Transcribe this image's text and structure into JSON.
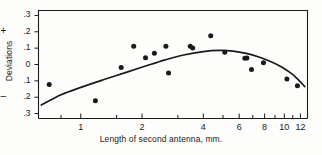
{
  "figure": {
    "background_color": "#fdfdfb",
    "ink_color": "#1a1a1a"
  },
  "axes": {
    "y_axis_label": "Deviations",
    "y_sign_positive": "+",
    "y_sign_negative": "–",
    "x_axis_caption": "Length of second antenna, mm."
  },
  "chart_data": {
    "type": "scatter",
    "title": "",
    "subtitle": "",
    "xlabel": "Length of second antenna, mm.",
    "ylabel": "Deviations",
    "xscale": "log",
    "yscale": "linear",
    "grid": false,
    "legend": null,
    "xlim": [
      0.62,
      13.0
    ],
    "ylim": [
      -0.33,
      0.33
    ],
    "xticks": [
      1,
      2,
      4,
      6,
      8,
      10,
      12
    ],
    "xticklabels": [
      "1",
      "2",
      "4",
      "6",
      "8",
      "10",
      "12"
    ],
    "x_minor_ticks": [
      0.8,
      1.5,
      3,
      5,
      7,
      9,
      11
    ],
    "yticks": [
      0.3,
      0.2,
      0.1,
      0,
      -0.1,
      -0.2,
      -0.3
    ],
    "yticklabels": [
      ".3",
      ".2",
      ".1",
      "0",
      ".1",
      ".2",
      ".3"
    ],
    "series": [
      {
        "name": "observed deviations",
        "type": "scatter",
        "marker": "filled-circle",
        "color": "#111111",
        "points": [
          {
            "x": 0.7,
            "y": -0.122
          },
          {
            "x": 1.18,
            "y": -0.222
          },
          {
            "x": 1.58,
            "y": -0.018
          },
          {
            "x": 1.82,
            "y": 0.112
          },
          {
            "x": 2.08,
            "y": 0.042
          },
          {
            "x": 2.3,
            "y": 0.068
          },
          {
            "x": 2.62,
            "y": 0.112
          },
          {
            "x": 2.7,
            "y": -0.052
          },
          {
            "x": 3.45,
            "y": 0.112
          },
          {
            "x": 3.55,
            "y": 0.101
          },
          {
            "x": 4.35,
            "y": 0.175
          },
          {
            "x": 5.1,
            "y": 0.075
          },
          {
            "x": 6.4,
            "y": 0.038
          },
          {
            "x": 6.55,
            "y": 0.04
          },
          {
            "x": 6.9,
            "y": -0.03
          },
          {
            "x": 7.9,
            "y": 0.01
          },
          {
            "x": 10.3,
            "y": -0.088
          },
          {
            "x": 11.6,
            "y": -0.13
          }
        ]
      },
      {
        "name": "fitted curve",
        "type": "line",
        "color": "#111111",
        "curve_points": [
          {
            "x": 0.64,
            "y": -0.248
          },
          {
            "x": 0.8,
            "y": -0.185
          },
          {
            "x": 1.0,
            "y": -0.14
          },
          {
            "x": 1.3,
            "y": -0.092
          },
          {
            "x": 1.7,
            "y": -0.045
          },
          {
            "x": 2.1,
            "y": -0.008
          },
          {
            "x": 2.6,
            "y": 0.028
          },
          {
            "x": 3.2,
            "y": 0.058
          },
          {
            "x": 4.0,
            "y": 0.079
          },
          {
            "x": 4.8,
            "y": 0.086
          },
          {
            "x": 5.6,
            "y": 0.082
          },
          {
            "x": 6.5,
            "y": 0.068
          },
          {
            "x": 7.5,
            "y": 0.046
          },
          {
            "x": 8.5,
            "y": 0.02
          },
          {
            "x": 9.6,
            "y": -0.012
          },
          {
            "x": 10.7,
            "y": -0.05
          },
          {
            "x": 11.7,
            "y": -0.092
          },
          {
            "x": 12.6,
            "y": -0.135
          }
        ]
      }
    ]
  }
}
